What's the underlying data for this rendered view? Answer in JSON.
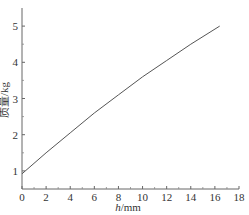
{
  "chart_data": {
    "type": "line",
    "title": "",
    "xlabel": "h/mm",
    "xlabel_italic_part": "h",
    "xlabel_unit": "/mm",
    "ylabel": "质量/kg",
    "xlim": [
      0,
      18
    ],
    "ylim": [
      0.5,
      5.5
    ],
    "x_ticks": [
      0,
      2,
      4,
      6,
      8,
      10,
      12,
      14,
      16,
      18
    ],
    "y_ticks": [
      1,
      2,
      3,
      4,
      5
    ],
    "grid": false,
    "legend": null,
    "series": [
      {
        "name": "mass",
        "x": [
          0,
          2,
          4,
          6,
          8,
          10,
          12,
          14,
          16.4
        ],
        "y": [
          0.92,
          1.5,
          2.05,
          2.6,
          3.1,
          3.6,
          4.05,
          4.5,
          5.0
        ],
        "color": "#555555"
      }
    ]
  }
}
